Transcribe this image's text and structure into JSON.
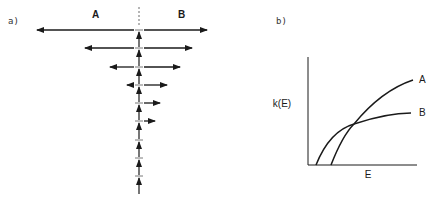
{
  "panel_a": {
    "label": "a)",
    "region_left": "A",
    "region_right": "B",
    "axis_x": 139,
    "rows": [
      {
        "y": 30,
        "left_x": 37,
        "right_x": 207
      },
      {
        "y": 48,
        "left_x": 85,
        "right_x": 192
      },
      {
        "y": 67,
        "left_x": 110,
        "right_x": 180
      },
      {
        "y": 85,
        "left_x": 128,
        "right_x": 167
      },
      {
        "y": 103,
        "left_x": null,
        "right_x": 160
      },
      {
        "y": 121,
        "left_x": null,
        "right_x": 155
      },
      {
        "y": 140,
        "left_x": null,
        "right_x": null
      },
      {
        "y": 158,
        "left_x": null,
        "right_x": null
      },
      {
        "y": 176,
        "left_x": null,
        "right_x": null
      }
    ]
  },
  "panel_b": {
    "label": "b)",
    "ylabel": "k(E)",
    "xlabel": "E",
    "curves": [
      {
        "name": "A",
        "label": "A"
      },
      {
        "name": "B",
        "label": "B"
      }
    ]
  }
}
